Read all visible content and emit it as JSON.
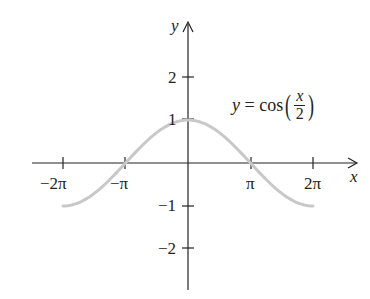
{
  "chart_data": {
    "type": "line",
    "title": "",
    "annotation": "y = cos(x/2)",
    "xlabel": "x",
    "ylabel": "y",
    "x_ticks": [
      "-2π",
      "-π",
      "π",
      "2π"
    ],
    "y_ticks": [
      "2",
      "1",
      "-1",
      "-2"
    ],
    "xlim": [
      -6.9,
      7.9
    ],
    "ylim": [
      -2.9,
      3.3
    ],
    "grid": false,
    "series": [
      {
        "name": "y = cos(x/2)",
        "color": "#c8c8c8",
        "x_range": [
          -6.2832,
          6.2832
        ],
        "x": [
          -6.2832,
          -4.7124,
          -3.1416,
          -1.5708,
          0,
          1.5708,
          3.1416,
          4.7124,
          6.2832
        ],
        "y": [
          -1,
          -0.7071,
          0,
          0.7071,
          1,
          0.7071,
          0,
          -0.7071,
          -1
        ]
      }
    ]
  },
  "labels": {
    "x_axis": "x",
    "y_axis": "y",
    "x_tick_neg2pi": "−2π",
    "x_tick_negpi": "−π",
    "x_tick_pi": "π",
    "x_tick_2pi": "2π",
    "y_tick_2": "2",
    "y_tick_1": "1",
    "y_tick_neg1": "−1",
    "y_tick_neg2": "−2",
    "eq_lhs": "y",
    "eq_eq": " = cos",
    "eq_num": "x",
    "eq_den": "2"
  }
}
